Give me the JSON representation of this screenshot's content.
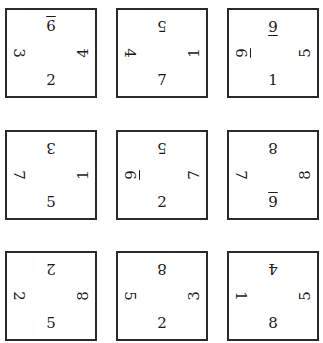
{
  "puzzle": {
    "grid_rows": 3,
    "grid_cols": 3,
    "border_color": "#2a2a2a",
    "cards": [
      {
        "pos": [
          5,
          8
        ],
        "top": {
          "v": "6",
          "rot": 0,
          "bar": true
        },
        "left": {
          "v": "3",
          "rot": 90,
          "bar": false
        },
        "right": {
          "v": "4",
          "rot": 270,
          "bar": false
        },
        "bottom": {
          "v": "2",
          "rot": 0,
          "bar": false
        }
      },
      {
        "pos": [
          116,
          8
        ],
        "top": {
          "v": "5",
          "rot": 180,
          "bar": false
        },
        "left": {
          "v": "4",
          "rot": 90,
          "bar": false
        },
        "right": {
          "v": "1",
          "rot": 270,
          "bar": false
        },
        "bottom": {
          "v": "7",
          "rot": 0,
          "bar": false
        }
      },
      {
        "pos": [
          227,
          8
        ],
        "top": {
          "v": "6",
          "rot": 180,
          "bar": true
        },
        "left": {
          "v": "6",
          "rot": 90,
          "bar": true
        },
        "right": {
          "v": "5",
          "rot": 270,
          "bar": false
        },
        "bottom": {
          "v": "1",
          "rot": 0,
          "bar": false
        }
      },
      {
        "pos": [
          5,
          130
        ],
        "top": {
          "v": "3",
          "rot": 180,
          "bar": false
        },
        "left": {
          "v": "7",
          "rot": 90,
          "bar": false
        },
        "right": {
          "v": "1",
          "rot": 270,
          "bar": false
        },
        "bottom": {
          "v": "5",
          "rot": 0,
          "bar": false
        }
      },
      {
        "pos": [
          116,
          130
        ],
        "top": {
          "v": "5",
          "rot": 180,
          "bar": false
        },
        "left": {
          "v": "6",
          "rot": 90,
          "bar": true
        },
        "right": {
          "v": "7",
          "rot": 270,
          "bar": false
        },
        "bottom": {
          "v": "2",
          "rot": 0,
          "bar": false
        }
      },
      {
        "pos": [
          227,
          130
        ],
        "top": {
          "v": "8",
          "rot": 180,
          "bar": false
        },
        "left": {
          "v": "7",
          "rot": 90,
          "bar": false
        },
        "right": {
          "v": "8",
          "rot": 270,
          "bar": false
        },
        "bottom": {
          "v": "9",
          "rot": 0,
          "bar": true
        }
      },
      {
        "pos": [
          5,
          251
        ],
        "top": {
          "v": "2",
          "rot": 180,
          "bar": false
        },
        "left": {
          "v": "2",
          "rot": 90,
          "bar": false
        },
        "right": {
          "v": "8",
          "rot": 270,
          "bar": false
        },
        "bottom": {
          "v": "5",
          "rot": 0,
          "bar": false
        }
      },
      {
        "pos": [
          116,
          251
        ],
        "top": {
          "v": "8",
          "rot": 180,
          "bar": false
        },
        "left": {
          "v": "5",
          "rot": 90,
          "bar": false
        },
        "right": {
          "v": "3",
          "rot": 270,
          "bar": false
        },
        "bottom": {
          "v": "2",
          "rot": 0,
          "bar": false
        }
      },
      {
        "pos": [
          227,
          251
        ],
        "top": {
          "v": "4",
          "rot": 180,
          "bar": false
        },
        "left": {
          "v": "1",
          "rot": 90,
          "bar": false
        },
        "right": {
          "v": "5",
          "rot": 270,
          "bar": false
        },
        "bottom": {
          "v": "8",
          "rot": 0,
          "bar": false
        }
      }
    ]
  }
}
